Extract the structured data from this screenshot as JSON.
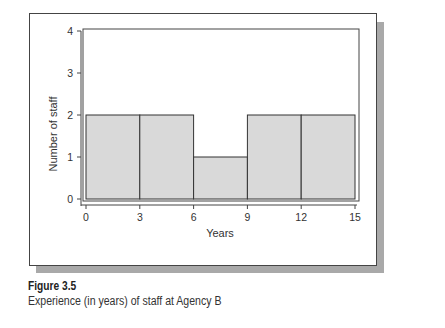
{
  "chart_data": {
    "type": "bar",
    "subtype": "histogram",
    "title": "",
    "xlabel": "Years",
    "ylabel": "Number of staff",
    "bins": [
      {
        "from": 0,
        "to": 3,
        "count": 2
      },
      {
        "from": 3,
        "to": 6,
        "count": 2
      },
      {
        "from": 6,
        "to": 9,
        "count": 1
      },
      {
        "from": 9,
        "to": 12,
        "count": 2
      },
      {
        "from": 12,
        "to": 15,
        "count": 2
      }
    ],
    "categories": [
      "0-3",
      "3-6",
      "6-9",
      "9-12",
      "12-15"
    ],
    "values": [
      2,
      2,
      1,
      2,
      2
    ],
    "x_ticks": [
      0,
      3,
      6,
      9,
      12,
      15
    ],
    "y_ticks": [
      0,
      1,
      2,
      3,
      4
    ],
    "xlim": [
      0,
      15
    ],
    "ylim": [
      0,
      4
    ],
    "grid": false,
    "legend": null,
    "bar_color": "#d9d9d9",
    "edge_color": "#333333"
  },
  "caption": {
    "figure_label": "Figure 3.5",
    "description": "Experience (in years) of staff at Agency B"
  }
}
